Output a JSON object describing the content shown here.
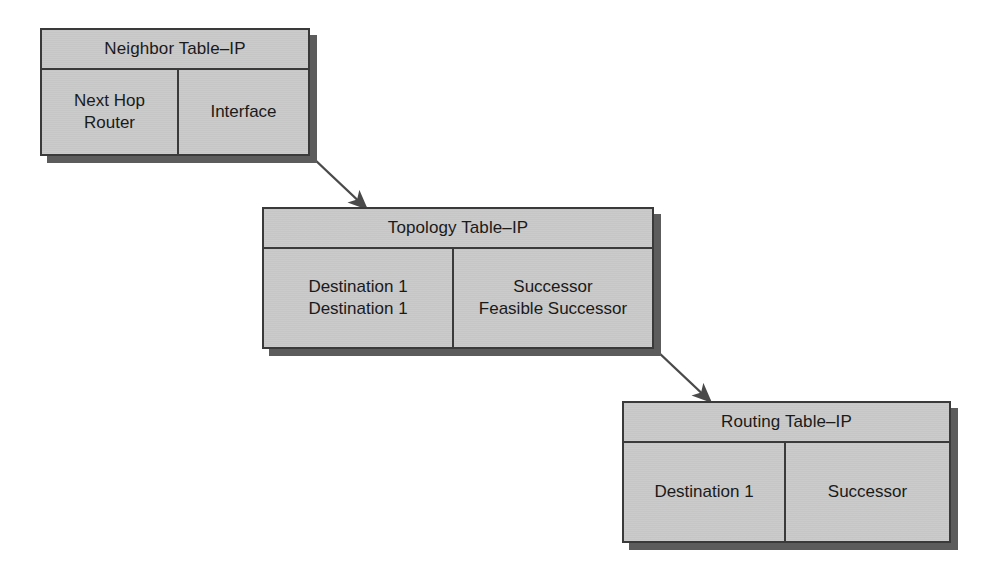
{
  "diagram": {
    "colors": {
      "box_fill": "#c9c9c9",
      "box_border": "#3a3a3a",
      "shadow": "#5c5c5c",
      "arrow": "#4a4a4a",
      "text": "#1a1a1a",
      "background": "#ffffff"
    },
    "tables": [
      {
        "id": "neighbor",
        "title": "Neighbor Table–IP",
        "columns": [
          {
            "lines": [
              "Next Hop",
              "Router"
            ]
          },
          {
            "lines": [
              "Interface"
            ]
          }
        ]
      },
      {
        "id": "topology",
        "title": "Topology Table–IP",
        "columns": [
          {
            "lines": [
              "Destination 1",
              "Destination 1"
            ]
          },
          {
            "lines": [
              "Successor",
              "Feasible Successor"
            ]
          }
        ]
      },
      {
        "id": "routing",
        "title": "Routing Table–IP",
        "columns": [
          {
            "lines": [
              "Destination 1"
            ]
          },
          {
            "lines": [
              "Successor"
            ]
          }
        ]
      }
    ],
    "connectors": [
      {
        "id": "neighbor-to-topology",
        "from": "neighbor",
        "to": "topology",
        "style": "arrow"
      },
      {
        "id": "topology-to-routing",
        "from": "topology",
        "to": "routing",
        "style": "arrow"
      }
    ]
  }
}
